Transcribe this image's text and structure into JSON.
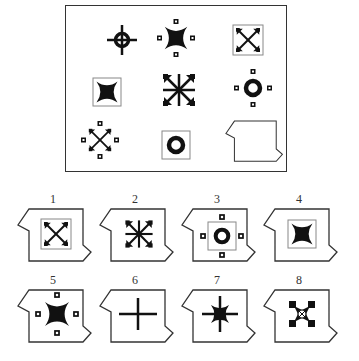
{
  "puzzle": {
    "type": "figure-matrix-3x3",
    "matrix": [
      {
        "row": 1,
        "col": 1,
        "figure": "crosshair-ring-icon"
      },
      {
        "row": 1,
        "col": 2,
        "figure": "four-point-star-with-dots-icon"
      },
      {
        "row": 1,
        "col": 3,
        "figure": "boxed-diagonal-arrows-icon"
      },
      {
        "row": 2,
        "col": 1,
        "figure": "boxed-four-point-star-icon"
      },
      {
        "row": 2,
        "col": 2,
        "figure": "eight-arrow-burst-icon"
      },
      {
        "row": 2,
        "col": 3,
        "figure": "ring-with-dots-icon"
      },
      {
        "row": 3,
        "col": 1,
        "figure": "diagonal-arrows-with-dots-icon"
      },
      {
        "row": 3,
        "col": 2,
        "figure": "boxed-ring-icon"
      },
      {
        "row": 3,
        "col": 3,
        "figure": "missing-piece-placeholder"
      }
    ],
    "options": [
      {
        "label": "1",
        "figure": "boxed-diagonal-arrows-icon"
      },
      {
        "label": "2",
        "figure": "eight-arrow-burst-icon"
      },
      {
        "label": "3",
        "figure": "boxed-ring-with-dots-icon"
      },
      {
        "label": "4",
        "figure": "boxed-four-point-star-icon"
      },
      {
        "label": "5",
        "figure": "four-point-star-with-dots-icon"
      },
      {
        "label": "6",
        "figure": "plain-cross-icon"
      },
      {
        "label": "7",
        "figure": "eight-point-star-icon"
      },
      {
        "label": "8",
        "figure": "castle-ring-icon"
      }
    ]
  },
  "colors": {
    "ink": "#111111",
    "frame": "#333333",
    "box": "#888888"
  }
}
